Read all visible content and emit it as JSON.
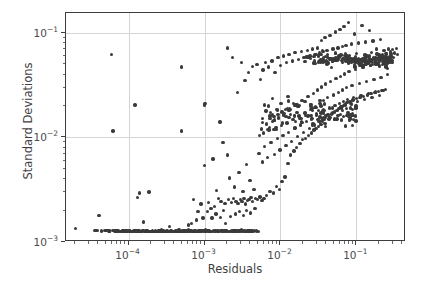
{
  "chart_data": {
    "type": "scatter",
    "title": "",
    "xlabel": "Residuals",
    "ylabel": "Standard Deviations",
    "xscale": "log",
    "yscale": "log",
    "xlim": [
      1.5e-05,
      0.45
    ],
    "ylim": [
      0.001,
      0.155
    ],
    "grid": true,
    "legend": null,
    "marker_color": "#3a3a3a",
    "marker_size_px": 3.4,
    "xticks": [
      0.0001,
      0.001,
      0.01,
      0.1
    ],
    "xticklabels": [
      "10⁻⁴",
      "10⁻³",
      "10⁻²",
      "10⁻¹"
    ],
    "yticks": [
      0.001,
      0.01,
      0.1
    ],
    "yticklabels": [
      "10⁻³",
      "10⁻²",
      "10⁻¹"
    ],
    "n_points": 604,
    "points": [
      [
        2e-05,
        0.00135
      ],
      [
        3.6e-05,
        0.00128
      ],
      [
        4.1e-05,
        0.0018
      ],
      [
        4.4e-05,
        0.00127
      ],
      [
        4.9e-05,
        0.00128
      ],
      [
        5.6e-05,
        0.00126
      ],
      [
        6e-05,
        0.062
      ],
      [
        6.2e-05,
        0.0115
      ],
      [
        6.6e-05,
        0.00127
      ],
      [
        7e-05,
        0.00126
      ],
      [
        7.4e-05,
        0.00127
      ],
      [
        7.9e-05,
        0.00126
      ],
      [
        8.3e-05,
        0.00127
      ],
      [
        8.8e-05,
        0.00126
      ],
      [
        9.2e-05,
        0.00127
      ],
      [
        9.7e-05,
        0.00126
      ],
      [
        0.000102,
        0.00127
      ],
      [
        0.000107,
        0.00126
      ],
      [
        0.000112,
        0.00126
      ],
      [
        0.000118,
        0.00127
      ],
      [
        0.000122,
        0.0205
      ],
      [
        0.000125,
        0.00126
      ],
      [
        0.00013,
        0.00265
      ],
      [
        0.000134,
        0.00127
      ],
      [
        0.000138,
        0.00295
      ],
      [
        0.000142,
        0.00126
      ],
      [
        0.000147,
        0.00126
      ],
      [
        0.000152,
        0.00127
      ],
      [
        0.000158,
        0.00155
      ],
      [
        0.000163,
        0.00126
      ],
      [
        0.000168,
        0.00126
      ],
      [
        0.000174,
        0.00127
      ],
      [
        0.00018,
        0.00126
      ],
      [
        0.000186,
        0.003
      ],
      [
        0.000192,
        0.00126
      ],
      [
        0.000198,
        0.00126
      ],
      [
        0.000205,
        0.00127
      ],
      [
        0.000212,
        0.00126
      ],
      [
        0.00022,
        0.00126
      ],
      [
        0.000228,
        0.00127
      ],
      [
        0.000236,
        0.00126
      ],
      [
        0.000244,
        0.00126
      ],
      [
        0.000252,
        0.00127
      ],
      [
        0.00026,
        0.00126
      ],
      [
        0.00027,
        0.00131
      ],
      [
        0.00028,
        0.00126
      ],
      [
        0.00029,
        0.00127
      ],
      [
        0.0003,
        0.00126
      ],
      [
        0.00031,
        0.00126
      ],
      [
        0.00032,
        0.00127
      ],
      [
        0.00033,
        0.00126
      ],
      [
        0.000345,
        0.0014
      ],
      [
        0.000355,
        0.00126
      ],
      [
        0.00037,
        0.00127
      ],
      [
        0.000385,
        0.00126
      ],
      [
        0.0004,
        0.00126
      ],
      [
        0.000415,
        0.00127
      ],
      [
        0.00043,
        0.00126
      ],
      [
        0.000445,
        0.00126
      ],
      [
        0.00046,
        0.00127
      ],
      [
        0.00048,
        0.00126
      ],
      [
        0.0005,
        0.047
      ],
      [
        0.0005,
        0.0115
      ],
      [
        0.000505,
        0.00126
      ],
      [
        0.00052,
        0.00127
      ],
      [
        0.00054,
        0.00126
      ],
      [
        0.00056,
        0.00126
      ],
      [
        0.00058,
        0.00127
      ],
      [
        0.0006,
        0.00126
      ],
      [
        0.00062,
        0.00145
      ],
      [
        0.00064,
        0.00126
      ],
      [
        0.00066,
        0.00127
      ],
      [
        0.00068,
        0.0015
      ],
      [
        0.0007,
        0.00126
      ],
      [
        0.00072,
        0.00255
      ],
      [
        0.00074,
        0.00127
      ],
      [
        0.00076,
        0.00126
      ],
      [
        0.00078,
        0.00162
      ],
      [
        0.0008,
        0.00126
      ],
      [
        0.00082,
        0.00195
      ],
      [
        0.00085,
        0.00127
      ],
      [
        0.00088,
        0.00126
      ],
      [
        0.0009,
        0.0023
      ],
      [
        0.00092,
        0.00126
      ],
      [
        0.00095,
        0.0017
      ],
      [
        0.00098,
        0.00127
      ],
      [
        0.001,
        0.0054
      ],
      [
        0.001,
        0.0205
      ],
      [
        0.00102,
        0.021
      ],
      [
        0.00105,
        0.00126
      ],
      [
        0.0011,
        0.00195
      ],
      [
        0.00112,
        0.0024
      ],
      [
        0.00115,
        0.00127
      ],
      [
        0.0012,
        0.00126
      ],
      [
        0.00122,
        0.0021
      ],
      [
        0.00125,
        0.0017
      ],
      [
        0.0013,
        0.0062
      ],
      [
        0.00132,
        0.00127
      ],
      [
        0.00135,
        0.0022
      ],
      [
        0.0014,
        0.00126
      ],
      [
        0.00142,
        0.00185
      ],
      [
        0.00145,
        0.0031
      ],
      [
        0.0015,
        0.00127
      ],
      [
        0.00152,
        0.0026
      ],
      [
        0.00155,
        0.00126
      ],
      [
        0.0016,
        0.014
      ],
      [
        0.00162,
        0.00172
      ],
      [
        0.00165,
        0.00245
      ],
      [
        0.0017,
        0.00127
      ],
      [
        0.00175,
        0.009
      ],
      [
        0.00178,
        0.002
      ],
      [
        0.0018,
        0.00126
      ],
      [
        0.00185,
        0.00235
      ],
      [
        0.0019,
        0.0015
      ],
      [
        0.00195,
        0.00127
      ],
      [
        0.002,
        0.072
      ],
      [
        0.002,
        0.0068
      ],
      [
        0.00205,
        0.00255
      ],
      [
        0.0021,
        0.00126
      ],
      [
        0.00215,
        0.0041
      ],
      [
        0.0022,
        0.00175
      ],
      [
        0.00225,
        0.0024
      ],
      [
        0.0023,
        0.00127
      ],
      [
        0.00235,
        0.058
      ],
      [
        0.0024,
        0.0026
      ],
      [
        0.00245,
        0.00126
      ],
      [
        0.0025,
        0.00335
      ],
      [
        0.00255,
        0.00185
      ],
      [
        0.0026,
        0.00245
      ],
      [
        0.00265,
        0.00127
      ],
      [
        0.0027,
        0.027
      ],
      [
        0.00275,
        0.00235
      ],
      [
        0.0028,
        0.00126
      ],
      [
        0.00285,
        0.0046
      ],
      [
        0.0029,
        0.00195
      ],
      [
        0.00295,
        0.00255
      ],
      [
        0.003,
        0.00127
      ],
      [
        0.00305,
        0.052
      ],
      [
        0.0031,
        0.00245
      ],
      [
        0.00315,
        0.00126
      ],
      [
        0.0032,
        0.00305
      ],
      [
        0.00325,
        0.0018
      ],
      [
        0.0033,
        0.0026
      ],
      [
        0.00335,
        0.00127
      ],
      [
        0.0034,
        0.035
      ],
      [
        0.00345,
        0.0023
      ],
      [
        0.0035,
        0.00126
      ],
      [
        0.00355,
        0.0055
      ],
      [
        0.0036,
        0.002
      ],
      [
        0.00365,
        0.0025
      ],
      [
        0.0037,
        0.00127
      ],
      [
        0.0038,
        0.042
      ],
      [
        0.00385,
        0.00255
      ],
      [
        0.0039,
        0.00126
      ],
      [
        0.00395,
        0.0039
      ],
      [
        0.004,
        0.0019
      ],
      [
        0.0041,
        0.00265
      ],
      [
        0.0042,
        0.00127
      ],
      [
        0.00425,
        0.048
      ],
      [
        0.0043,
        0.00245
      ],
      [
        0.0044,
        0.00126
      ],
      [
        0.0045,
        0.0032
      ],
      [
        0.0046,
        0.0021
      ],
      [
        0.0047,
        0.0026
      ],
      [
        0.0048,
        0.00127
      ],
      [
        0.0049,
        0.05
      ],
      [
        0.005,
        0.00255
      ],
      [
        0.0051,
        0.00126
      ],
      [
        0.0052,
        0.007
      ],
      [
        0.0053,
        0.0105
      ],
      [
        0.0054,
        0.0027
      ],
      [
        0.0055,
        0.036
      ],
      [
        0.0056,
        0.012
      ],
      [
        0.0057,
        0.0025
      ],
      [
        0.0058,
        0.0058
      ],
      [
        0.0059,
        0.044
      ],
      [
        0.006,
        0.011
      ],
      [
        0.0061,
        0.0026
      ],
      [
        0.0062,
        0.0082
      ],
      [
        0.0063,
        0.052
      ],
      [
        0.0065,
        0.0135
      ],
      [
        0.0066,
        0.0028
      ],
      [
        0.0068,
        0.0064
      ],
      [
        0.007,
        0.047
      ],
      [
        0.0071,
        0.0118
      ],
      [
        0.0073,
        0.00305
      ],
      [
        0.0075,
        0.009
      ],
      [
        0.0077,
        0.054
      ],
      [
        0.0079,
        0.0142
      ],
      [
        0.0081,
        0.00295
      ],
      [
        0.0083,
        0.0069
      ],
      [
        0.0085,
        0.042
      ],
      [
        0.0087,
        0.0125
      ],
      [
        0.0089,
        0.0034
      ],
      [
        0.0091,
        0.0098
      ],
      [
        0.0093,
        0.058
      ],
      [
        0.0095,
        0.0155
      ],
      [
        0.0097,
        0.0032
      ],
      [
        0.0099,
        0.0076
      ],
      [
        0.0101,
        0.049
      ],
      [
        0.0103,
        0.013
      ],
      [
        0.0105,
        0.0038
      ],
      [
        0.0108,
        0.0105
      ],
      [
        0.011,
        0.06
      ],
      [
        0.0112,
        0.017
      ],
      [
        0.0115,
        0.0042
      ],
      [
        0.0118,
        0.0084
      ],
      [
        0.012,
        0.052
      ],
      [
        0.0122,
        0.0138
      ],
      [
        0.0125,
        0.0056
      ],
      [
        0.0128,
        0.0112
      ],
      [
        0.013,
        0.062
      ],
      [
        0.0133,
        0.0185
      ],
      [
        0.0136,
        0.0068
      ],
      [
        0.014,
        0.0092
      ],
      [
        0.0143,
        0.054
      ],
      [
        0.0146,
        0.0148
      ],
      [
        0.015,
        0.0074
      ],
      [
        0.0153,
        0.0122
      ],
      [
        0.0156,
        0.065
      ],
      [
        0.016,
        0.0205
      ],
      [
        0.0164,
        0.008
      ],
      [
        0.0168,
        0.0102
      ],
      [
        0.0172,
        0.056
      ],
      [
        0.0176,
        0.016
      ],
      [
        0.018,
        0.0088
      ],
      [
        0.0184,
        0.0132
      ],
      [
        0.0188,
        0.066
      ],
      [
        0.0192,
        0.0225
      ],
      [
        0.0196,
        0.0095
      ],
      [
        0.02,
        0.0112
      ],
      [
        0.0205,
        0.058
      ],
      [
        0.021,
        0.0172
      ],
      [
        0.0215,
        0.0098
      ],
      [
        0.022,
        0.0142
      ],
      [
        0.0225,
        0.068
      ],
      [
        0.023,
        0.0245
      ],
      [
        0.0235,
        0.0105
      ],
      [
        0.024,
        0.0122
      ],
      [
        0.0245,
        0.06
      ],
      [
        0.025,
        0.0185
      ],
      [
        0.0255,
        0.011
      ],
      [
        0.026,
        0.0152
      ],
      [
        0.0265,
        0.07
      ],
      [
        0.027,
        0.0265
      ],
      [
        0.0275,
        0.0118
      ],
      [
        0.028,
        0.0132
      ],
      [
        0.0285,
        0.062
      ],
      [
        0.029,
        0.0198
      ],
      [
        0.0295,
        0.0122
      ],
      [
        0.03,
        0.0162
      ],
      [
        0.0305,
        0.072
      ],
      [
        0.031,
        0.0285
      ],
      [
        0.0315,
        0.0128
      ],
      [
        0.032,
        0.0142
      ],
      [
        0.0325,
        0.064
      ],
      [
        0.033,
        0.021
      ],
      [
        0.0335,
        0.0135
      ],
      [
        0.034,
        0.0172
      ],
      [
        0.0345,
        0.085
      ],
      [
        0.035,
        0.0305
      ],
      [
        0.0355,
        0.0142
      ],
      [
        0.036,
        0.0152
      ],
      [
        0.0365,
        0.066
      ],
      [
        0.037,
        0.0225
      ],
      [
        0.0375,
        0.0148
      ],
      [
        0.038,
        0.0182
      ],
      [
        0.0385,
        0.09
      ],
      [
        0.039,
        0.0325
      ],
      [
        0.0395,
        0.0155
      ],
      [
        0.04,
        0.0162
      ],
      [
        0.041,
        0.068
      ],
      [
        0.042,
        0.024
      ],
      [
        0.043,
        0.0162
      ],
      [
        0.044,
        0.0192
      ],
      [
        0.045,
        0.095
      ],
      [
        0.046,
        0.0345
      ],
      [
        0.047,
        0.0168
      ],
      [
        0.048,
        0.0172
      ],
      [
        0.049,
        0.07
      ],
      [
        0.05,
        0.0255
      ],
      [
        0.051,
        0.0175
      ],
      [
        0.052,
        0.0202
      ],
      [
        0.053,
        0.102
      ],
      [
        0.054,
        0.0365
      ],
      [
        0.055,
        0.0182
      ],
      [
        0.056,
        0.0182
      ],
      [
        0.057,
        0.072
      ],
      [
        0.058,
        0.027
      ],
      [
        0.059,
        0.0188
      ],
      [
        0.06,
        0.0212
      ],
      [
        0.061,
        0.108
      ],
      [
        0.062,
        0.0385
      ],
      [
        0.063,
        0.0195
      ],
      [
        0.064,
        0.0192
      ],
      [
        0.065,
        0.074
      ],
      [
        0.066,
        0.0285
      ],
      [
        0.067,
        0.0202
      ],
      [
        0.068,
        0.0222
      ],
      [
        0.069,
        0.115
      ],
      [
        0.07,
        0.0405
      ],
      [
        0.071,
        0.0208
      ],
      [
        0.072,
        0.0202
      ],
      [
        0.073,
        0.076
      ],
      [
        0.074,
        0.03
      ],
      [
        0.075,
        0.0215
      ],
      [
        0.076,
        0.0232
      ],
      [
        0.078,
        0.125
      ],
      [
        0.08,
        0.0425
      ],
      [
        0.082,
        0.0222
      ],
      [
        0.084,
        0.0212
      ],
      [
        0.086,
        0.078
      ],
      [
        0.088,
        0.0315
      ],
      [
        0.09,
        0.0228
      ],
      [
        0.092,
        0.0242
      ],
      [
        0.095,
        0.098
      ],
      [
        0.098,
        0.0445
      ],
      [
        0.1,
        0.0235
      ],
      [
        0.103,
        0.0222
      ],
      [
        0.106,
        0.08
      ],
      [
        0.109,
        0.033
      ],
      [
        0.112,
        0.0242
      ],
      [
        0.115,
        0.0252
      ],
      [
        0.118,
        0.118
      ],
      [
        0.122,
        0.0465
      ],
      [
        0.125,
        0.0248
      ],
      [
        0.128,
        0.0232
      ],
      [
        0.132,
        0.082
      ],
      [
        0.136,
        0.0345
      ],
      [
        0.14,
        0.0255
      ],
      [
        0.144,
        0.0262
      ],
      [
        0.148,
        0.105
      ],
      [
        0.152,
        0.0485
      ],
      [
        0.156,
        0.0262
      ],
      [
        0.16,
        0.0242
      ],
      [
        0.165,
        0.084
      ],
      [
        0.17,
        0.036
      ],
      [
        0.175,
        0.0268
      ],
      [
        0.18,
        0.0272
      ],
      [
        0.185,
        0.07
      ],
      [
        0.19,
        0.0505
      ],
      [
        0.195,
        0.0275
      ],
      [
        0.2,
        0.0252
      ],
      [
        0.206,
        0.086
      ],
      [
        0.212,
        0.0375
      ],
      [
        0.218,
        0.0282
      ],
      [
        0.224,
        0.0282
      ],
      [
        0.23,
        0.068
      ],
      [
        0.236,
        0.0525
      ],
      [
        0.242,
        0.0288
      ],
      [
        0.25,
        0.062
      ],
      [
        0.258,
        0.04
      ],
      [
        0.266,
        0.07
      ],
      [
        0.274,
        0.054
      ],
      [
        0.282,
        0.066
      ],
      [
        0.29,
        0.06
      ],
      [
        0.3,
        0.069
      ],
      [
        0.31,
        0.058
      ],
      [
        0.32,
        0.064
      ],
      [
        0.335,
        0.071
      ],
      [
        0.35,
        0.062
      ]
    ],
    "cluster_fills": [
      {
        "note": "dense saturated cluster",
        "x_range": [
          0.02,
          0.3
        ],
        "y_range": [
          0.04,
          0.078
        ],
        "count": 200
      },
      {
        "note": "mid transition band",
        "x_range": [
          0.005,
          0.1
        ],
        "y_range": [
          0.008,
          0.035
        ],
        "count": 120
      },
      {
        "note": "floor band",
        "x_range": [
          3.5e-05,
          0.005
        ],
        "y_range": [
          0.00124,
          0.00132
        ],
        "count": 90
      }
    ]
  }
}
